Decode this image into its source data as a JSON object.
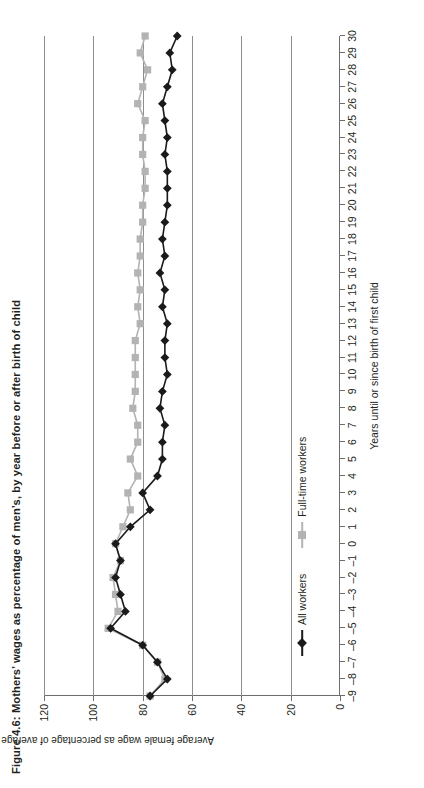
{
  "figure": {
    "title": "Figure 4.6: Mothers’ wages as percentage of men’s, by year before or after birth of child",
    "rotation": "90deg counter-clockwise"
  },
  "colors": {
    "all_workers": "#1a1a1a",
    "full_time_workers": "#b3b3b3",
    "axis": "#6d6d6d",
    "grid": "#8d8d8d",
    "text": "#231f20"
  },
  "legend": {
    "position": "bottom-left-inside",
    "items": [
      {
        "label": "All workers",
        "marker": "diamond",
        "color": "#1a1a1a"
      },
      {
        "label": "Full-time workers",
        "marker": "square",
        "color": "#b3b3b3"
      }
    ]
  },
  "chart_data": {
    "type": "line",
    "title": "Figure 4.6: Mothers’ wages as percentage of men’s, by year before or after birth of child",
    "xlabel": "Years until or since birth of first child",
    "ylabel": "Average female wage as percentage of average male wage",
    "xlim": [
      -9,
      30
    ],
    "ylim": [
      0,
      120
    ],
    "yticks": [
      0,
      20,
      40,
      60,
      80,
      100,
      120
    ],
    "ytick_labels": [
      "0",
      "20",
      "40",
      "60",
      "80",
      "100",
      "120"
    ],
    "xticks": [
      -9,
      -8,
      -7,
      -6,
      -5,
      -4,
      -3,
      -2,
      -1,
      0,
      1,
      2,
      3,
      4,
      5,
      6,
      7,
      8,
      9,
      10,
      11,
      12,
      13,
      14,
      15,
      16,
      17,
      18,
      19,
      20,
      21,
      22,
      23,
      24,
      25,
      26,
      27,
      28,
      29,
      30
    ],
    "xtick_labels": [
      "–9",
      "–8",
      "–7",
      "–6",
      "–5",
      "–4",
      "–3",
      "–2",
      "–1",
      "0",
      "1",
      "2",
      "3",
      "4",
      "5",
      "6",
      "7",
      "8",
      "9",
      "10",
      "11",
      "12",
      "13",
      "14",
      "15",
      "16",
      "17",
      "18",
      "19",
      "20",
      "21",
      "22",
      "23",
      "24",
      "25",
      "26",
      "27",
      "28",
      "29",
      "30"
    ],
    "grid": "horizontal-at-y-20-40-60-80-100-120",
    "x": [
      -9,
      -8,
      -7,
      -6,
      -5,
      -4,
      -3,
      -2,
      -1,
      0,
      1,
      2,
      3,
      4,
      5,
      6,
      7,
      8,
      9,
      10,
      11,
      12,
      13,
      14,
      15,
      16,
      17,
      18,
      19,
      20,
      21,
      22,
      23,
      24,
      25,
      26,
      27,
      28,
      29,
      30
    ],
    "series": [
      {
        "name": "All workers",
        "marker": "diamond",
        "color": "#1a1a1a",
        "values": [
          77,
          70,
          74,
          80,
          93,
          87,
          89,
          91,
          89,
          91,
          85,
          77,
          80,
          74,
          72,
          72,
          71,
          73,
          72,
          70,
          71,
          71,
          70,
          72,
          71,
          73,
          71,
          72,
          71,
          70,
          70,
          70,
          71,
          70,
          71,
          72,
          70,
          68,
          69,
          66
        ]
      },
      {
        "name": "Full-time workers",
        "marker": "square",
        "color": "#b3b3b3",
        "values": [
          77,
          71,
          74,
          80,
          94,
          90,
          91,
          92,
          89,
          91,
          88,
          85,
          86,
          82,
          85,
          82,
          82,
          84,
          83,
          83,
          83,
          83,
          81,
          82,
          81,
          82,
          81,
          81,
          80,
          80,
          79,
          79,
          80,
          80,
          79,
          82,
          80,
          78,
          81,
          79
        ]
      }
    ]
  }
}
